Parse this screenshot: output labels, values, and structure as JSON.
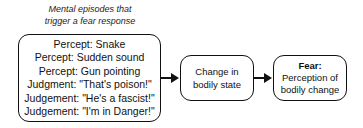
{
  "caption": {
    "line1": "Mental episodes that",
    "line2": "trigger a fear response"
  },
  "episodes_box": {
    "items": [
      "Percept: Snake",
      "Percept: Sudden sound",
      "Percept: Gun pointing",
      "Judgment: \"That's poison!\"",
      "Judgement: \"He's a fascist!\"",
      "Judgement: \"I'm in Danger!\""
    ]
  },
  "bodily_box": {
    "line1": "Change in",
    "line2": "bodily state"
  },
  "fear_box": {
    "title": "Fear:",
    "line1": "Perception of",
    "line2": "bodily change"
  },
  "colors": {
    "stroke": "#111111",
    "background": "#ffffff"
  }
}
